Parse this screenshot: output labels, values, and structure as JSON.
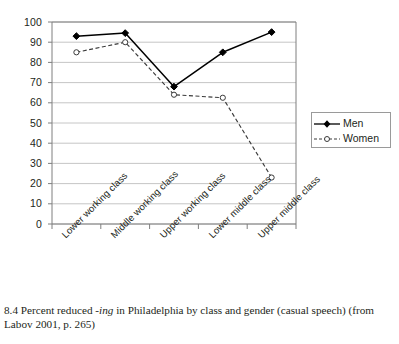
{
  "figure": {
    "caption_number": "8.4",
    "caption_text_before_italic": "Percent reduced ",
    "caption_italic": "-ing",
    "caption_text_after_italic": " in Philadelphia by class and gender (casual speech)",
    "caption_source": "(from Labov 2001, p. 265)",
    "caption_full": "8.4 Percent reduced -ing in Philadelphia by class and gender (casual speech) (from Labov 2001, p. 265)"
  },
  "legend": {
    "position": "right",
    "items": [
      {
        "label": "Men",
        "marker": "filled-diamond",
        "line": "solid",
        "color": "#000000"
      },
      {
        "label": "Women",
        "marker": "open-circle",
        "line": "dashed",
        "color": "#3b3b3b"
      }
    ]
  },
  "axis": {
    "y_ticks": [
      "100",
      "90",
      "80",
      "70",
      "60",
      "50",
      "40",
      "30",
      "20",
      "10",
      "0"
    ],
    "x_ticks": [
      "Lower working class",
      "Middle working class",
      "Upper working class",
      "Lower middle class",
      "Upper middle class"
    ]
  },
  "chart_data": {
    "type": "line",
    "title": "",
    "subtitle": "",
    "xlabel": "",
    "ylabel": "",
    "ylim": [
      0,
      100
    ],
    "ytick_step": 10,
    "grid": "horizontal",
    "legend_position": "right",
    "categories": [
      "Lower working class",
      "Middle working class",
      "Upper working class",
      "Lower middle class",
      "Upper middle class"
    ],
    "series": [
      {
        "name": "Men",
        "marker": "filled-diamond",
        "linestyle": "solid",
        "color": "#000000",
        "values": [
          93,
          94.5,
          68,
          85,
          95
        ]
      },
      {
        "name": "Women",
        "marker": "open-circle",
        "linestyle": "dashed",
        "color": "#3b3b3b",
        "values": [
          85,
          90,
          64,
          62.5,
          23
        ]
      }
    ]
  },
  "colors": {
    "axis": "#7f7f7f",
    "grid": "#bfbfbf",
    "men": "#000000",
    "women": "#3b3b3b",
    "text": "#231f20"
  }
}
